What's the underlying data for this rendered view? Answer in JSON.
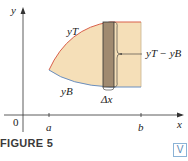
{
  "figure": {
    "caption": "FIGURE 5",
    "badge": "V",
    "labels": {
      "y_axis": "y",
      "x_axis": "x",
      "origin": "0",
      "a": "a",
      "b": "b",
      "top_curve": "yT",
      "bottom_curve": "yB",
      "strip_height": "yT − yB",
      "strip_width": "Δx"
    },
    "colors": {
      "region_fill": "#f5dfb8",
      "strip_fill": "#a08a70",
      "top_curve": "#d9604a",
      "bottom_curve": "#6a8fc0",
      "axis": "#333333"
    }
  }
}
